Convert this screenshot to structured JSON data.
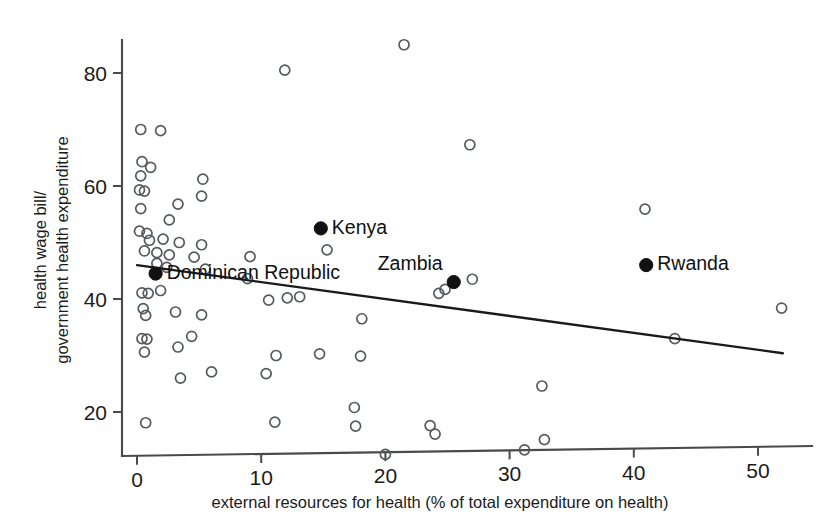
{
  "chart_data": {
    "type": "scatter",
    "title": "",
    "xlabel": "external resources for health (% of total expenditure on health)",
    "ylabel_line1": "health wage bill/",
    "ylabel_line2": "government health expenditure",
    "ylabel": "health wage bill/ government health expenditure",
    "xlim": [
      -1.5,
      54
    ],
    "ylim": [
      10,
      88
    ],
    "xticks": [
      0,
      10,
      20,
      30,
      40,
      50
    ],
    "xticklabels": [
      "0",
      "10",
      "20",
      "30",
      "40",
      "50"
    ],
    "yticks": [
      20,
      40,
      60,
      80
    ],
    "yticklabels": [
      "20",
      "40",
      "60",
      "80"
    ],
    "grid": false,
    "legend": "none",
    "marker_open_color": "#555a5e",
    "marker_filled_color": "#111111",
    "fitline_color": "#1a1a1a",
    "axis_color": "#4a4a4a",
    "background_color": "#ffffff",
    "trendline": {
      "label": "linear fit",
      "x_start": 0.0,
      "y_start": 46.0,
      "x_end": 52.0,
      "y_end": 30.4,
      "slope": -0.3,
      "intercept": 46.0
    },
    "highlighted_points": [
      {
        "label": "Dominican Republic",
        "x": 1.5,
        "y": 44.5,
        "label_side": "right"
      },
      {
        "label": "Kenya",
        "x": 14.8,
        "y": 52.5,
        "label_side": "right"
      },
      {
        "label": "Zambia",
        "x": 25.5,
        "y": 43.0,
        "label_side": "upleft"
      },
      {
        "label": "Rwanda",
        "x": 41.0,
        "y": 46.0,
        "label_side": "right"
      }
    ],
    "points": [
      {
        "x": 0.3,
        "y": 70.0
      },
      {
        "x": 1.9,
        "y": 69.8
      },
      {
        "x": 0.4,
        "y": 64.3
      },
      {
        "x": 1.1,
        "y": 63.3
      },
      {
        "x": 0.3,
        "y": 61.8
      },
      {
        "x": 5.3,
        "y": 61.2
      },
      {
        "x": 0.2,
        "y": 59.3
      },
      {
        "x": 0.6,
        "y": 59.1
      },
      {
        "x": 5.2,
        "y": 58.2
      },
      {
        "x": 3.3,
        "y": 56.8
      },
      {
        "x": 0.3,
        "y": 56.0
      },
      {
        "x": 2.6,
        "y": 54.0
      },
      {
        "x": 0.2,
        "y": 52.0
      },
      {
        "x": 0.8,
        "y": 51.6
      },
      {
        "x": 1.0,
        "y": 50.4
      },
      {
        "x": 2.1,
        "y": 50.6
      },
      {
        "x": 3.4,
        "y": 50.0
      },
      {
        "x": 5.2,
        "y": 49.6
      },
      {
        "x": 0.6,
        "y": 48.5
      },
      {
        "x": 1.6,
        "y": 48.2
      },
      {
        "x": 2.6,
        "y": 47.8
      },
      {
        "x": 4.6,
        "y": 47.4
      },
      {
        "x": 9.1,
        "y": 47.5
      },
      {
        "x": 15.3,
        "y": 48.7
      },
      {
        "x": 1.6,
        "y": 46.3
      },
      {
        "x": 2.4,
        "y": 45.6
      },
      {
        "x": 5.5,
        "y": 45.3
      },
      {
        "x": 8.9,
        "y": 43.6
      },
      {
        "x": 0.4,
        "y": 41.1
      },
      {
        "x": 0.9,
        "y": 41.0
      },
      {
        "x": 1.9,
        "y": 41.5
      },
      {
        "x": 12.1,
        "y": 40.2
      },
      {
        "x": 10.6,
        "y": 39.8
      },
      {
        "x": 13.1,
        "y": 40.4
      },
      {
        "x": 24.3,
        "y": 41.0
      },
      {
        "x": 27.0,
        "y": 43.5
      },
      {
        "x": 24.8,
        "y": 41.7
      },
      {
        "x": 0.5,
        "y": 38.3
      },
      {
        "x": 0.7,
        "y": 37.1
      },
      {
        "x": 3.1,
        "y": 37.7
      },
      {
        "x": 5.2,
        "y": 37.2
      },
      {
        "x": 18.1,
        "y": 36.5
      },
      {
        "x": 51.9,
        "y": 38.4
      },
      {
        "x": 0.4,
        "y": 33.0
      },
      {
        "x": 0.8,
        "y": 32.9
      },
      {
        "x": 4.4,
        "y": 33.4
      },
      {
        "x": 3.3,
        "y": 31.5
      },
      {
        "x": 11.2,
        "y": 30.0
      },
      {
        "x": 14.7,
        "y": 30.3
      },
      {
        "x": 18.0,
        "y": 29.9
      },
      {
        "x": 43.3,
        "y": 33.0
      },
      {
        "x": 0.6,
        "y": 30.6
      },
      {
        "x": 6.0,
        "y": 27.1
      },
      {
        "x": 10.4,
        "y": 26.8
      },
      {
        "x": 3.5,
        "y": 26.0
      },
      {
        "x": 32.6,
        "y": 24.6
      },
      {
        "x": 17.5,
        "y": 20.8
      },
      {
        "x": 0.7,
        "y": 18.1
      },
      {
        "x": 11.1,
        "y": 18.2
      },
      {
        "x": 17.6,
        "y": 17.5
      },
      {
        "x": 23.6,
        "y": 17.6
      },
      {
        "x": 24.0,
        "y": 16.1
      },
      {
        "x": 32.8,
        "y": 15.1
      },
      {
        "x": 31.2,
        "y": 13.3
      },
      {
        "x": 20.0,
        "y": 12.5
      },
      {
        "x": 11.9,
        "y": 80.5
      },
      {
        "x": 21.5,
        "y": 85.0
      },
      {
        "x": 26.8,
        "y": 67.3
      },
      {
        "x": 40.9,
        "y": 55.9
      }
    ]
  }
}
